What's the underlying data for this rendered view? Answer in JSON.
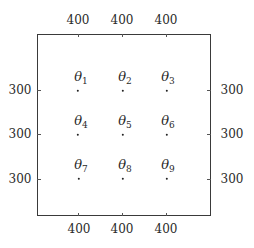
{
  "axes": {
    "top_labels": [
      "400",
      "400",
      "400"
    ],
    "bottom_labels": [
      "400",
      "400",
      "400"
    ],
    "left_labels": [
      "300",
      "300",
      "300"
    ],
    "right_labels": [
      "300",
      "300",
      "300"
    ]
  },
  "points": [
    {
      "symbol": "θ",
      "index": "1"
    },
    {
      "symbol": "θ",
      "index": "2"
    },
    {
      "symbol": "θ",
      "index": "3"
    },
    {
      "symbol": "θ",
      "index": "4"
    },
    {
      "symbol": "θ",
      "index": "5"
    },
    {
      "symbol": "θ",
      "index": "6"
    },
    {
      "symbol": "θ",
      "index": "7"
    },
    {
      "symbol": "θ",
      "index": "8"
    },
    {
      "symbol": "θ",
      "index": "9"
    }
  ]
}
